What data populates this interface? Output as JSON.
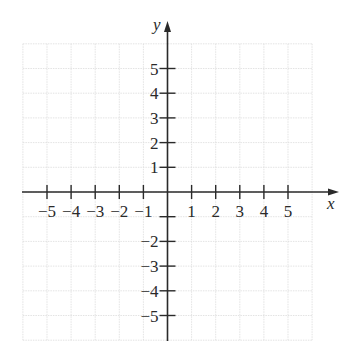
{
  "chart_data": {
    "type": "scatter",
    "title": "",
    "xlabel": "x",
    "ylabel": "y",
    "xlim": [
      -6,
      6
    ],
    "ylim": [
      -6,
      6
    ],
    "grid": true,
    "x_ticks": [
      -5,
      -4,
      -3,
      -2,
      -1,
      1,
      2,
      3,
      4,
      5
    ],
    "x_tick_labels": [
      "−5",
      "−4",
      "−3",
      "−2",
      "−1",
      "1",
      "2",
      "3",
      "4",
      "5"
    ],
    "y_ticks": [
      5,
      4,
      3,
      2,
      1,
      -1,
      -2,
      -3,
      -4,
      -5
    ],
    "y_tick_labels": [
      "5",
      "4",
      "3",
      "2",
      "1",
      "",
      "−2",
      "−3",
      "−4",
      "−5"
    ],
    "series": [],
    "legend": null
  },
  "colors": {
    "axis": "#2a2a2a",
    "grid": "#dcdcdc",
    "background": "#ffffff"
  }
}
